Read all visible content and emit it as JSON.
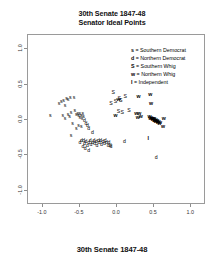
{
  "figure": {
    "title_lines": [
      "30th Senate 1847-48",
      "Senator Ideal Points"
    ],
    "caption": "30th Senate 1847-48"
  },
  "legend": {
    "entries": [
      {
        "key": "s",
        "sep": " = ",
        "label": "Southern Democrat"
      },
      {
        "key": "d",
        "sep": " = ",
        "label": "Northern Democrat"
      },
      {
        "key": "S",
        "sep": " = ",
        "label": "Southern Whig"
      },
      {
        "key": "w",
        "sep": " = ",
        "label": "Northern Whig"
      },
      {
        "key": "I",
        "sep": " = ",
        "label": "Independent"
      }
    ]
  },
  "axes": {
    "x_ticks": [
      "-1.0",
      "-0.5",
      "0.0",
      "0.5",
      "1.0"
    ],
    "y_ticks": [
      "1.0",
      "0.5",
      "0.0",
      "-0.5",
      "-1.0"
    ]
  },
  "chart_data": {
    "type": "scatter",
    "title": "30th Senate 1847-48 Senator Ideal Points",
    "xlabel": "",
    "ylabel": "",
    "xlim": [
      -1.2,
      1.2
    ],
    "ylim": [
      -1.2,
      1.2
    ],
    "xticks": [
      -1.0,
      -0.5,
      0.0,
      0.5,
      1.0
    ],
    "yticks": [
      -1.0,
      -0.5,
      0.0,
      0.5,
      1.0
    ],
    "grid": false,
    "legend_position": "upper right",
    "marker_style": "text-glyph",
    "series": [
      {
        "name": "Southern Democrat",
        "marker": "s",
        "points": [
          [
            -0.9,
            0.05
          ],
          [
            -0.78,
            0.23
          ],
          [
            -0.75,
            0.26
          ],
          [
            -0.72,
            0.27
          ],
          [
            -0.7,
            0.2
          ],
          [
            -0.68,
            0.3
          ],
          [
            -0.66,
            0.28
          ],
          [
            -0.63,
            0.31
          ],
          [
            -0.73,
            0.05
          ],
          [
            -0.7,
            0.02
          ],
          [
            -0.66,
            0.07
          ],
          [
            -0.64,
            0.04
          ],
          [
            -0.62,
            0.1
          ],
          [
            -0.58,
            0.31
          ],
          [
            -0.57,
            0.13
          ],
          [
            -0.55,
            0.07
          ],
          [
            -0.53,
            0.09
          ],
          [
            -0.52,
            0.05
          ],
          [
            -0.5,
            0.08
          ],
          [
            -0.5,
            0.03
          ],
          [
            -0.48,
            0.06
          ],
          [
            -0.47,
            0.01
          ],
          [
            -0.46,
            0.09
          ],
          [
            -0.45,
            0.04
          ],
          [
            -0.6,
            -0.05
          ],
          [
            -0.52,
            -0.08
          ],
          [
            -0.48,
            -0.1
          ],
          [
            -0.55,
            -0.13
          ],
          [
            -0.62,
            -0.22
          ]
        ]
      },
      {
        "name": "Northern Democrat",
        "marker": "d",
        "points": [
          [
            -0.44,
            -0.02
          ],
          [
            -0.42,
            -0.06
          ],
          [
            -0.4,
            -0.09
          ],
          [
            -0.38,
            -0.13
          ],
          [
            -0.33,
            -0.19
          ],
          [
            -0.45,
            -0.3
          ],
          [
            -0.44,
            -0.34
          ],
          [
            -0.42,
            -0.31
          ],
          [
            -0.4,
            -0.36
          ],
          [
            -0.38,
            -0.33
          ],
          [
            -0.36,
            -0.3
          ],
          [
            -0.35,
            -0.35
          ],
          [
            -0.33,
            -0.32
          ],
          [
            -0.31,
            -0.29
          ],
          [
            -0.3,
            -0.34
          ],
          [
            -0.28,
            -0.31
          ],
          [
            -0.27,
            -0.36
          ],
          [
            -0.25,
            -0.3
          ],
          [
            -0.24,
            -0.33
          ],
          [
            -0.22,
            -0.29
          ],
          [
            -0.21,
            -0.35
          ],
          [
            -0.19,
            -0.31
          ],
          [
            -0.17,
            -0.34
          ],
          [
            -0.16,
            -0.29
          ],
          [
            -0.14,
            -0.33
          ],
          [
            -0.12,
            -0.37
          ],
          [
            -0.11,
            -0.32
          ],
          [
            -0.09,
            -0.36
          ],
          [
            -0.08,
            -0.38
          ],
          [
            -0.48,
            -0.29
          ],
          [
            -0.5,
            -0.33
          ],
          [
            -0.46,
            -0.38
          ],
          [
            -0.43,
            -0.41
          ],
          [
            -0.38,
            -0.44
          ],
          [
            0.1,
            -0.31
          ],
          [
            0.53,
            -0.53
          ]
        ]
      },
      {
        "name": "Southern Whig",
        "marker": "S",
        "points": [
          [
            -0.05,
            0.38
          ],
          [
            -0.08,
            0.22
          ],
          [
            -0.02,
            0.25
          ],
          [
            0.03,
            0.3
          ],
          [
            0.05,
            0.27
          ],
          [
            0.11,
            0.32
          ],
          [
            0.02,
            0.12
          ],
          [
            0.07,
            0.1
          ],
          [
            0.16,
            0.13
          ]
        ]
      },
      {
        "name": "Northern Whig",
        "marker": "w",
        "points": [
          [
            0.02,
            0.28
          ],
          [
            0.29,
            0.33
          ],
          [
            0.45,
            0.36
          ],
          [
            0.46,
            0.22
          ],
          [
            0.26,
            0.09
          ],
          [
            0.3,
            0.08
          ],
          [
            0.32,
            0.04
          ],
          [
            0.28,
            0.03
          ],
          [
            -0.02,
            0.05
          ],
          [
            0.44,
            0.04
          ],
          [
            0.45,
            0.02
          ],
          [
            0.46,
            0.03
          ],
          [
            0.47,
            0.01
          ],
          [
            0.48,
            0.02
          ],
          [
            0.48,
            0.0
          ],
          [
            0.49,
            0.01
          ],
          [
            0.5,
            -0.01
          ],
          [
            0.5,
            0.01
          ],
          [
            0.51,
            -0.02
          ],
          [
            0.52,
            0.0
          ],
          [
            0.52,
            -0.03
          ],
          [
            0.53,
            -0.01
          ],
          [
            0.54,
            -0.03
          ],
          [
            0.54,
            -0.02
          ],
          [
            0.55,
            -0.04
          ],
          [
            0.56,
            -0.03
          ],
          [
            0.57,
            -0.05
          ],
          [
            0.58,
            -0.04
          ],
          [
            0.63,
            0.02
          ],
          [
            0.62,
            -0.1
          ]
        ]
      },
      {
        "name": "Independent",
        "marker": "I",
        "points": [
          [
            0.42,
            -0.27
          ]
        ]
      }
    ]
  }
}
